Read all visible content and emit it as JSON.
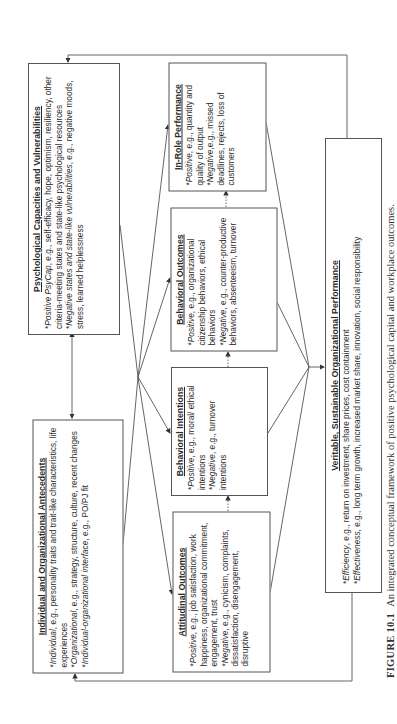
{
  "figure": {
    "label": "FIGURE 10.1",
    "caption": "An integrated conceptual framework of positive psychological capital and workplace outcomes."
  },
  "boxes": {
    "psych_capacities": {
      "title": "Psychological Capacities and Vulnerabilities",
      "items": [
        {
          "bullet": "*",
          "lead": "Positive PsyCap",
          "text": ", e.g., self-efficacy, hope, optimism, resiliency, other criteria-meeting states and state-like psychological resources"
        },
        {
          "bullet": "*",
          "lead": "Negative states and state-like vulnerabilities",
          "text": ", e.g., negative moods, stress, learned helplessness"
        }
      ]
    },
    "antecedents": {
      "title": "Individual and Organizational Antecedents",
      "items": [
        {
          "bullet": "*",
          "lead": "Individual",
          "text": ", e.g., personality traits and trait-like characteristics, life experiences"
        },
        {
          "bullet": "*",
          "lead": "Organizational",
          "text": ", e.g., strategy, structure, culture, recent changes"
        },
        {
          "bullet": "*",
          "lead": "Individual-organizational interface",
          "text": ", e.g., PO/PJ fit"
        }
      ]
    },
    "in_role": {
      "title": "In-Role Performance",
      "items": [
        {
          "bullet": "*",
          "lead": "Positive",
          "text": ", e.g., quantity and quality of output"
        },
        {
          "bullet": "*",
          "lead": "Negative",
          "text": ",e.g., missed deadlines, rejects, loss of customers"
        }
      ]
    },
    "behavioral_outcomes": {
      "title": "Behavioral Outcomes",
      "items": [
        {
          "bullet": "*",
          "lead": "Positive",
          "text": ", e.g., organizational citizenship behaviors, ethical behaviors"
        },
        {
          "bullet": "*",
          "lead": "Negative",
          "text": ", e.g., counter-productive behaviors, absenteeism, turnover"
        }
      ]
    },
    "behavioral_intentions": {
      "title": "Behavioral Intentions",
      "items": [
        {
          "bullet": "*",
          "lead": "Positive",
          "text": ", e.g., moral/ ethical intentions"
        },
        {
          "bullet": "*",
          "lead": "Negative",
          "text": ", e.g., turnover intentions"
        }
      ]
    },
    "attitudinal_outcomes": {
      "title": "Attitudinal Outcomes",
      "items": [
        {
          "bullet": "*",
          "lead": "Positive",
          "text": ", e.g., job satisfaction, work happiness, organizational commitment, engagement, trust"
        },
        {
          "bullet": "*",
          "lead": "Negative",
          "text": ", e.g., cynicism, complaints, dissatisfaction, disengagement, disruptive"
        }
      ]
    },
    "veritable": {
      "title": "Veritable, Sustainable Organizational Performance",
      "items": [
        {
          "bullet": "*",
          "lead": "Efficiency",
          "text": ", e.g., return on investment, share prices, cost containment"
        },
        {
          "bullet": "*",
          "lead": "Effectiveness",
          "text": ", e.g., long term growth, increased market share, innovation, social responsibility"
        }
      ]
    }
  },
  "colors": {
    "line": "#555555",
    "text": "#2a2a2a",
    "background": "#ffffff"
  }
}
